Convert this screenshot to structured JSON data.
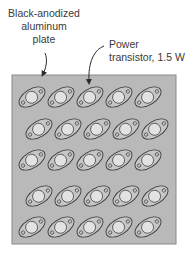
{
  "labels": {
    "plate_line1": "Black-anodized",
    "plate_line2": "aluminum",
    "plate_line3": "plate",
    "transistor_line1": "Power",
    "transistor_line2": "transistor, 1.5 W"
  },
  "colors": {
    "plate_fill": "#b9b9b9",
    "plate_border": "#8a8a8a",
    "transistor_body": "#c6c6c6",
    "transistor_outline": "#3c3c3c",
    "transistor_cap": "#e2e2e2",
    "label_text": "#3a3a3a"
  },
  "plate": {
    "x": 12,
    "y": 75,
    "width": 164,
    "height": 169
  },
  "transistor_grid": {
    "rows": 5,
    "cols": 5,
    "total": 25,
    "power_each": "1.5 W",
    "rows_y": [
      97,
      129,
      160,
      196,
      227
    ],
    "row_x": [
      [
        32,
        61,
        90,
        119,
        148
      ],
      [
        39,
        68,
        97,
        126,
        155
      ],
      [
        32,
        61,
        90,
        119,
        148
      ],
      [
        39,
        68,
        97,
        126,
        155
      ],
      [
        32,
        61,
        90,
        119,
        148
      ]
    ]
  }
}
